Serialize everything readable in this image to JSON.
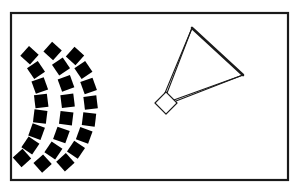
{
  "figure": {
    "canvas": {
      "width": 297,
      "height": 193,
      "background": "#ffffff"
    },
    "frame": {
      "name": "outer-border",
      "x": 11,
      "y": 13,
      "width": 277,
      "height": 167,
      "stroke": "#1a1a1a",
      "stroke_width": 2.2,
      "fill": "none"
    },
    "array": {
      "label": "curved-square-array",
      "fill": "#000000",
      "square_size": 13,
      "center_x": -32,
      "center_y": 107,
      "arcs": [
        {
          "name": "inner-arc",
          "radius": 68,
          "count": 8,
          "angle_start": -52,
          "angle_end": 52,
          "squares": [
            {
              "cx": 29.5,
              "cy": 55.2,
              "rot": -48
            },
            {
              "cx": 36.0,
              "cy": 70.0,
              "rot": -34
            },
            {
              "cx": 39.8,
              "cy": 85.5,
              "rot": -20
            },
            {
              "cx": 41.2,
              "cy": 101.0,
              "rot": -7
            },
            {
              "cx": 40.2,
              "cy": 116.6,
              "rot": 7
            },
            {
              "cx": 36.6,
              "cy": 131.6,
              "rot": 20
            },
            {
              "cx": 30.4,
              "cy": 145.6,
              "rot": 34
            },
            {
              "cx": 22.0,
              "cy": 158.0,
              "rot": 48
            }
          ]
        },
        {
          "name": "middle-arc",
          "radius": 90,
          "count": 8,
          "angle_start": -52,
          "angle_end": 52,
          "squares": [
            {
              "cx": 52.6,
              "cy": 51.0,
              "rot": -48
            },
            {
              "cx": 61.0,
              "cy": 66.5,
              "rot": -34
            },
            {
              "cx": 66.0,
              "cy": 83.4,
              "rot": -20
            },
            {
              "cx": 67.6,
              "cy": 100.8,
              "rot": -7
            },
            {
              "cx": 66.2,
              "cy": 118.2,
              "rot": 7
            },
            {
              "cx": 61.4,
              "cy": 135.0,
              "rot": 20
            },
            {
              "cx": 53.4,
              "cy": 150.4,
              "rot": 34
            },
            {
              "cx": 42.6,
              "cy": 163.6,
              "rot": 48
            }
          ]
        },
        {
          "name": "outer-arc",
          "radius": 110,
          "count": 8,
          "angle_start": -52,
          "angle_end": 52,
          "squares": [
            {
              "cx": 75.0,
              "cy": 56.0,
              "rot": -48
            },
            {
              "cx": 83.4,
              "cy": 70.0,
              "rot": -34
            },
            {
              "cx": 88.6,
              "cy": 86.0,
              "rot": -20
            },
            {
              "cx": 90.6,
              "cy": 102.6,
              "rot": -7
            },
            {
              "cx": 89.0,
              "cy": 119.4,
              "rot": 7
            },
            {
              "cx": 84.2,
              "cy": 135.4,
              "rot": 20
            },
            {
              "cx": 76.0,
              "cy": 149.8,
              "rot": 34
            },
            {
              "cx": 65.4,
              "cy": 162.2,
              "rot": 48
            }
          ]
        }
      ]
    },
    "triangle": {
      "name": "triangle-outline",
      "apex": {
        "x": 192,
        "y": 28
      },
      "right_vertex": {
        "x": 243,
        "y": 75
      },
      "left_vertex": {
        "x": 160,
        "y": 105
      },
      "stroke": "#1a1a1a",
      "fill": "none",
      "edges": [
        {
          "name": "edge-apex-to-right",
          "thickness": 2.6
        },
        {
          "name": "edge-right-to-left",
          "thickness": 1.1
        },
        {
          "name": "edge-left-to-apex",
          "thickness": 1.1
        }
      ]
    },
    "diamond": {
      "name": "diamond-outline",
      "center_x": 166,
      "center_y": 103,
      "half_diagonal": 11,
      "rotation": 45,
      "stroke": "#1a1a1a",
      "stroke_width": 1.2,
      "fill": "#ffffff"
    },
    "connectors": [
      {
        "name": "connector-to-apex",
        "x1": 167,
        "y1": 93,
        "x2": 192,
        "y2": 28,
        "stroke_width": 1.1
      },
      {
        "name": "connector-to-right-vertex",
        "x1": 176,
        "y1": 101,
        "x2": 243,
        "y2": 75,
        "stroke_width": 1.1
      }
    ],
    "colors": {
      "ink": "#1a1a1a",
      "solid_fill": "#000000",
      "paper": "#ffffff"
    }
  }
}
